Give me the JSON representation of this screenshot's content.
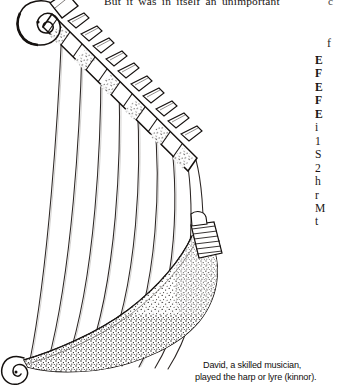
{
  "page": {
    "background": "#ffffff",
    "ink": "#15110f"
  },
  "body_text": {
    "top_line": "But it was in itself an unimportant",
    "top_right_fragment": "c"
  },
  "right_column": {
    "floating_glyph": "f",
    "entries": [
      {
        "text": "E",
        "bold": true
      },
      {
        "text": "F",
        "bold": true
      },
      {
        "text": "E",
        "bold": true
      },
      {
        "text": "F",
        "bold": true
      },
      {
        "text": "E",
        "bold": true
      },
      {
        "text": "i",
        "bold": false
      },
      {
        "text": "1",
        "bold": false
      },
      {
        "text": "S",
        "bold": false
      },
      {
        "text": "2",
        "bold": false
      },
      {
        "text": "h",
        "bold": false
      },
      {
        "text": "r",
        "bold": false
      },
      {
        "text": "M",
        "bold": false
      },
      {
        "text": "t",
        "bold": false
      }
    ]
  },
  "illustration": {
    "name": "ancient-harp-lyre-engraving",
    "style": "black-and-white line engraving with stipple shading",
    "parts": [
      "scroll-volute-head",
      "tuning-peg-neck",
      "strings",
      "curved-soundbox",
      "string-anchor-band",
      "lower-scroll-terminal"
    ],
    "string_count": 9,
    "peg_count": 9
  },
  "caption": {
    "line1": "David, a skilled musician,",
    "line2": "played the harp or lyre (kinnor)."
  }
}
